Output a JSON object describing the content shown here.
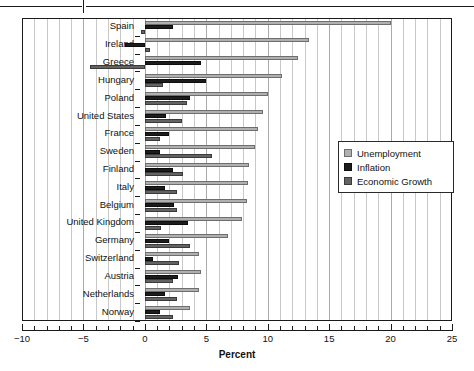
{
  "chart_data": {
    "type": "bar",
    "orientation": "horizontal",
    "title": "",
    "xlabel": "Percent",
    "ylabel": "",
    "xlim": [
      -10,
      25
    ],
    "xticks": [
      -10,
      -5,
      0,
      5,
      10,
      15,
      20,
      25
    ],
    "xticklabels": [
      "−10",
      "−5",
      "0",
      "5",
      "10",
      "15",
      "20",
      "25"
    ],
    "minor_tick_step": 1,
    "grid": true,
    "grid_axis": "x",
    "legend_position": "center-right",
    "categories": [
      "Spain",
      "Ireland",
      "Greece",
      "Hungary",
      "Poland",
      "United States",
      "France",
      "Sweden",
      "Finland",
      "Italy",
      "Belgium",
      "United Kingdom",
      "Germany",
      "Switzerland",
      "Austria",
      "Netherlands",
      "Norway"
    ],
    "series": [
      {
        "name": "Unemployment",
        "color": "#b0b0b0",
        "values": [
          20.0,
          13.4,
          12.5,
          11.2,
          10.0,
          9.6,
          9.2,
          9.0,
          8.5,
          8.4,
          8.3,
          7.9,
          6.8,
          4.4,
          4.6,
          4.4,
          3.7
        ]
      },
      {
        "name": "Inflation",
        "color": "#1c1c1c",
        "values": [
          2.3,
          -1.6,
          4.6,
          5.0,
          3.7,
          1.7,
          2.0,
          1.2,
          2.3,
          1.6,
          2.4,
          3.5,
          2.0,
          0.7,
          2.7,
          1.6,
          1.2
        ]
      },
      {
        "name": "Economic Growth",
        "color": "#636363",
        "values": [
          -0.3,
          0.4,
          -4.5,
          1.5,
          3.4,
          3.0,
          1.2,
          5.5,
          3.1,
          2.6,
          2.6,
          1.3,
          3.7,
          2.8,
          2.3,
          2.6,
          2.3
        ]
      }
    ],
    "legend": [
      "Unemployment",
      "Inflation",
      "Economic Growth"
    ],
    "colors": {
      "unemployment": "#b0b0b0",
      "inflation": "#1c1c1c",
      "growth": "#636363",
      "axis": "#1a1a1a",
      "gridline": "#aaaaaa"
    }
  }
}
